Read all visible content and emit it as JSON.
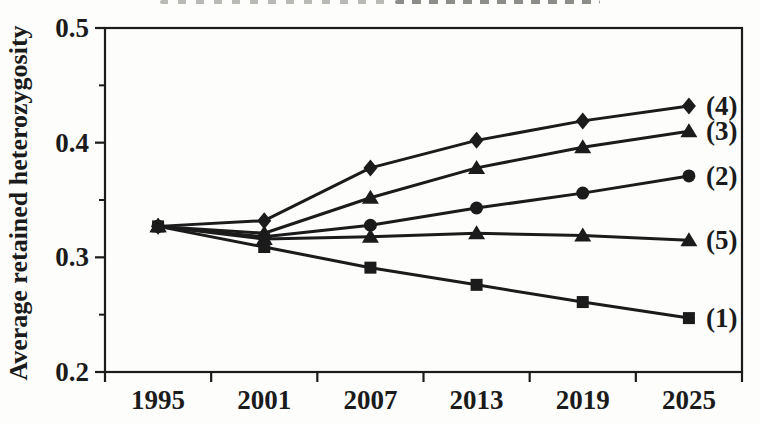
{
  "figure": {
    "background_color": "#fdfdfb",
    "ink_color": "#1b1b1b"
  },
  "chart_data": {
    "type": "line",
    "title": "",
    "xlabel": "",
    "ylabel": "Average retained heterozygosity",
    "x": [
      1995,
      2001,
      2007,
      2013,
      2019,
      2025
    ],
    "x_tick_labels": [
      "1995",
      "2001",
      "2007",
      "2013",
      "2019",
      "2025"
    ],
    "ylim": [
      0.2,
      0.5
    ],
    "y_major_ticks": [
      0.5,
      0.4,
      0.3,
      0.2
    ],
    "y_major_tick_labels": [
      "0.5",
      "0.4",
      "0.3",
      "0.2"
    ],
    "y_minor_ticks": [
      0.45,
      0.35,
      0.25
    ],
    "grid": false,
    "legend_position": "end-of-line-labels-inside-plot",
    "line_color": "#1b1b1b",
    "marker_color": "#1b1b1b",
    "series": [
      {
        "name": "(4)",
        "marker": "diamond",
        "values": [
          0.327,
          0.332,
          0.378,
          0.402,
          0.419,
          0.432
        ]
      },
      {
        "name": "(3)",
        "marker": "triangle",
        "values": [
          0.327,
          0.321,
          0.352,
          0.378,
          0.396,
          0.41
        ]
      },
      {
        "name": "(2)",
        "marker": "circle",
        "values": [
          0.327,
          0.318,
          0.328,
          0.343,
          0.356,
          0.371
        ]
      },
      {
        "name": "(5)",
        "marker": "triangle",
        "values": [
          0.327,
          0.316,
          0.318,
          0.321,
          0.319,
          0.315
        ]
      },
      {
        "name": "(1)",
        "marker": "square",
        "values": [
          0.327,
          0.309,
          0.291,
          0.276,
          0.261,
          0.247
        ]
      }
    ]
  }
}
